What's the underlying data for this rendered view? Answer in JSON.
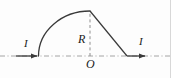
{
  "figure": {
    "type": "physics-circuit-diagram",
    "background_color": "#fdfdfd",
    "stroke_color": "#3a3a3a",
    "axis_color": "#8a8a8a",
    "width": 171,
    "height": 78,
    "labels": {
      "current_left": "I",
      "current_right": "I",
      "radius": "R",
      "origin": "O"
    },
    "geometry": {
      "origin_point": [
        90,
        56
      ],
      "arc_start_point": [
        38,
        56
      ],
      "arc_peak_point": [
        90,
        11
      ],
      "radius_px": 45,
      "left_lead_start": [
        16,
        56
      ],
      "left_arrow_tip": [
        38,
        56
      ],
      "diagonal_end": [
        127,
        56
      ],
      "right_arrow_tip": [
        146,
        56
      ],
      "axis_y": 56,
      "vertical_dashed_x": 90
    }
  }
}
